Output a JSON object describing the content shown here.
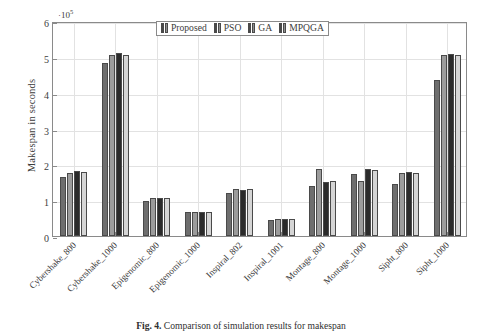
{
  "figure": {
    "caption_label": "Fig. 4.",
    "caption_text": "Comparison of simulation results for makespan"
  },
  "axis": {
    "exponent_prefix": "·10",
    "exponent_power": "5"
  },
  "chart_data": {
    "type": "bar",
    "title": "",
    "xlabel": "",
    "ylabel": "Makespan in seconds",
    "ylim": [
      0,
      6
    ],
    "yticks": [
      0,
      1,
      2,
      3,
      4,
      5,
      6
    ],
    "ytick_labels": [
      "0",
      "1",
      "2",
      "3",
      "4",
      "5",
      "6"
    ],
    "y_scale_note": "values in units of 1e5 seconds",
    "grid": true,
    "legend_position": "upper center",
    "categories": [
      "Cybershake_800",
      "Cybershake_1000",
      "Epigenomic_800",
      "Epigenomic_1000",
      "Inspiral_802",
      "Inspiral_1001",
      "Montage_800",
      "Montage_1000",
      "Sipht_800",
      "Sipht_1000"
    ],
    "series": [
      {
        "name": "Proposed",
        "color": "#6e6e6e",
        "values": [
          1.64,
          4.82,
          0.97,
          0.66,
          1.19,
          0.44,
          1.4,
          1.72,
          1.46,
          4.35
        ]
      },
      {
        "name": "PSO",
        "color": "#9c9c9c",
        "values": [
          1.77,
          5.05,
          1.05,
          0.68,
          1.3,
          0.47,
          1.87,
          1.53,
          1.76,
          5.05
        ]
      },
      {
        "name": "GA",
        "color": "#2b2b2b",
        "values": [
          1.81,
          5.1,
          1.05,
          0.68,
          1.28,
          0.48,
          1.5,
          1.88,
          1.79,
          5.09
        ]
      },
      {
        "name": "MPQGA",
        "color": "#d5d5d5",
        "values": [
          1.78,
          5.05,
          1.05,
          0.68,
          1.3,
          0.47,
          1.54,
          1.85,
          1.76,
          5.04
        ]
      }
    ]
  }
}
